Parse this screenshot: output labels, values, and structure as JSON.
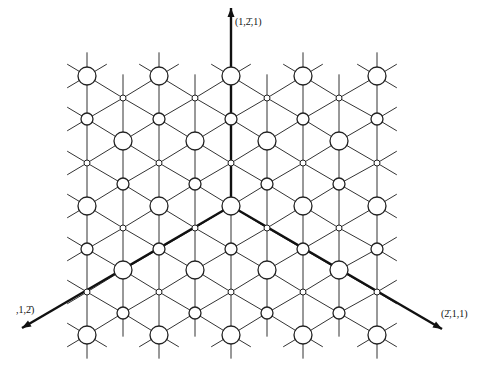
{
  "diagram": {
    "colors": {
      "line": "#333333",
      "axis": "#111111",
      "node_fill": "#ffffff",
      "background": "#ffffff"
    },
    "origin": {
      "x": 231,
      "y": 206
    },
    "lattice": {
      "column_xs": [
        87,
        123,
        159,
        195,
        231,
        267,
        303,
        339,
        377
      ],
      "even_rows": [
        76,
        119,
        163,
        206,
        249,
        292,
        335
      ],
      "even_sizes": [
        "L",
        "M",
        "S",
        "L",
        "M",
        "S",
        "L"
      ],
      "odd_rows": [
        98,
        141,
        184,
        228,
        270,
        313
      ],
      "odd_sizes": [
        "S",
        "L",
        "M",
        "S",
        "L",
        "M"
      ],
      "radii": {
        "L": 9,
        "M": 6,
        "S": 3
      }
    },
    "axes": [
      {
        "name": "axis-up",
        "label": "(1,2̄,1)",
        "tip": {
          "x": 231,
          "y": 8
        },
        "label_pos": {
          "x": 235,
          "y": 25
        }
      },
      {
        "name": "axis-lower-left",
        "label": ",1,2̄)",
        "tip": {
          "x": 22,
          "y": 328
        },
        "label_pos": {
          "x": 16,
          "y": 313
        }
      },
      {
        "name": "axis-lower-right",
        "label": "(2̄,1,1)",
        "tip": {
          "x": 442,
          "y": 329
        },
        "label_pos": {
          "x": 441,
          "y": 317
        }
      }
    ]
  }
}
